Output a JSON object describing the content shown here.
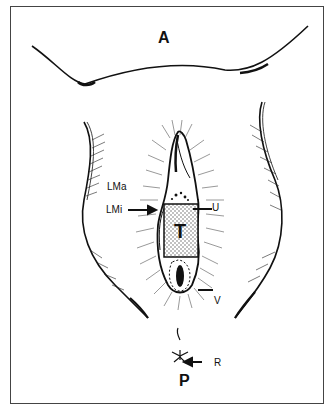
{
  "figure": {
    "orientation": {
      "anterior": "A",
      "posterior": "P"
    },
    "labels": {
      "labia_majora": "LMa",
      "labia_minora": "LMi",
      "urethra": "U",
      "tumor": "T",
      "vagina": "V",
      "rectum": "R"
    },
    "colors": {
      "ink": "#111111",
      "background": "#ffffff",
      "frame": "#444444",
      "stipple": "#888888"
    }
  }
}
